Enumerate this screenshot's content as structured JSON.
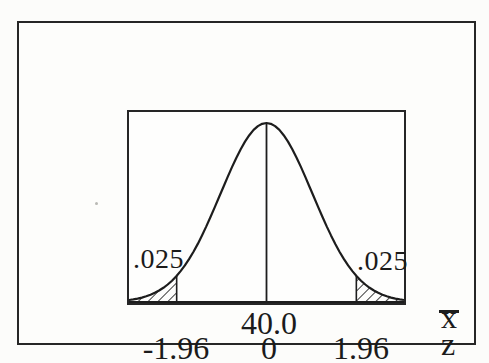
{
  "figure": {
    "tail_label_left": ".025",
    "tail_label_right": ".025",
    "xbar_tick": "40.0",
    "xbar_axis_label": "x",
    "z_ticks": [
      "-1.96",
      "0",
      "1.96"
    ],
    "z_axis_label": "z"
  },
  "chart_data": {
    "type": "area",
    "subtype": "normal-distribution-curve",
    "mean": {
      "xbar_scale": 40.0,
      "z_scale": 0
    },
    "critical_values_z": [
      -1.96,
      1.96
    ],
    "tail_areas": [
      0.025,
      0.025
    ],
    "axes": [
      {
        "name": "x̄",
        "ticks": [
          "40.0"
        ]
      },
      {
        "name": "z",
        "ticks": [
          "-1.96",
          "0",
          "1.96"
        ]
      }
    ],
    "z_display_range": [
      -3,
      3
    ],
    "hatch_style": "diagonal",
    "line_color": "#1d1d1d",
    "grid": "off",
    "legend": "none"
  }
}
